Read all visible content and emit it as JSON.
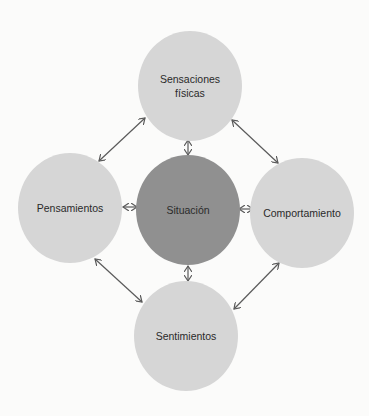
{
  "diagram": {
    "type": "cycle-relationship",
    "colors": {
      "background": "#fbfbfa",
      "outer_node": "#d6d6d6",
      "center_node": "#909090",
      "arrow": "#5a5a5a",
      "text": "#2a2a2a"
    },
    "nodes": {
      "top": {
        "line1": "Sensaciones",
        "line2": "físicas"
      },
      "left": {
        "label": "Pensamientos"
      },
      "center": {
        "label": "Situación"
      },
      "right": {
        "label": "Comportamiento"
      },
      "bottom": {
        "label": "Sentimientos"
      }
    },
    "edges": [
      {
        "from": "Sensaciones físicas",
        "to": "Situación",
        "type": "bidirectional"
      },
      {
        "from": "Pensamientos",
        "to": "Situación",
        "type": "bidirectional"
      },
      {
        "from": "Comportamiento",
        "to": "Situación",
        "type": "bidirectional"
      },
      {
        "from": "Sentimientos",
        "to": "Situación",
        "type": "bidirectional"
      },
      {
        "from": "Sensaciones físicas",
        "to": "Pensamientos",
        "type": "bidirectional"
      },
      {
        "from": "Sensaciones físicas",
        "to": "Comportamiento",
        "type": "bidirectional"
      },
      {
        "from": "Pensamientos",
        "to": "Sentimientos",
        "type": "bidirectional"
      },
      {
        "from": "Comportamiento",
        "to": "Sentimientos",
        "type": "bidirectional"
      }
    ]
  }
}
